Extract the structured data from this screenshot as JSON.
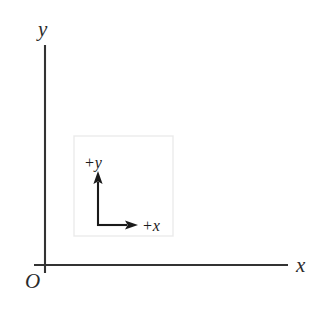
{
  "figure": {
    "background_color": "#ffffff"
  },
  "axes": {
    "line_color": "#333333",
    "line_width": 2,
    "origin_label": "O",
    "x_axis": {
      "label": "x",
      "direction": "right",
      "start_px": [
        45,
        265
      ],
      "end_px": [
        288,
        265
      ]
    },
    "y_axis": {
      "label": "y",
      "direction": "up",
      "start_px": [
        45,
        273
      ],
      "end_px": [
        45,
        45
      ]
    }
  },
  "inset": {
    "border_color": "#ebebeb",
    "fill_color": "#ffffff",
    "bounds_px": [
      74,
      136,
      99,
      100
    ],
    "arrow_color": "#1a1a1a",
    "arrow_width": 2,
    "corner_px": [
      98,
      225
    ],
    "y_arrow": {
      "label": "+y",
      "direction": "up",
      "tip_px": [
        98,
        172
      ]
    },
    "x_arrow": {
      "label": "+x",
      "direction": "right",
      "tip_px": [
        137,
        225
      ]
    }
  }
}
